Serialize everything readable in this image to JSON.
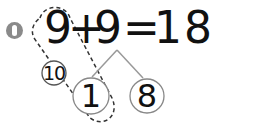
{
  "problem": {
    "number": "1",
    "equation": {
      "addend1": "9",
      "plus": "+",
      "addend2": "9",
      "equals": "=",
      "sum": "18"
    },
    "make_ten_circle": "10",
    "split": {
      "left": "1",
      "right": "8"
    }
  },
  "colors": {
    "text": "#111111",
    "badge": "#8a8a8a",
    "lines": "#999999",
    "circles": "#555555",
    "dashed": "#333333"
  }
}
